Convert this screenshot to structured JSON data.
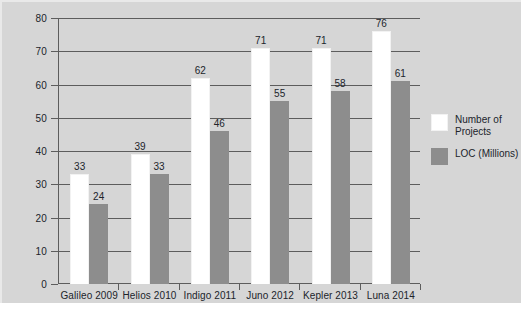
{
  "chart_data": {
    "type": "bar",
    "title": "",
    "subtitle": "",
    "xlabel": "",
    "ylabel": "",
    "ylim": [
      0,
      80
    ],
    "ytick_step": 10,
    "yticks": [
      0,
      10,
      20,
      30,
      40,
      50,
      60,
      70,
      80
    ],
    "grid": true,
    "grid_axis": "y",
    "legend_position": "right",
    "categories": [
      "Galileo 2009",
      "Helios 2010",
      "Indigo 2011",
      "Juno 2012",
      "Kepler 2013",
      "Luna 2014"
    ],
    "series": [
      {
        "name": "Number of Projects",
        "color": "#ffffff",
        "values": [
          33,
          39,
          62,
          71,
          71,
          76
        ],
        "labels": [
          "33",
          "39",
          "62",
          "71",
          "71",
          "76"
        ]
      },
      {
        "name": "LOC (Millions)",
        "color": "#8d8d8d",
        "values": [
          24,
          33,
          46,
          55,
          58,
          61
        ],
        "labels": [
          "24",
          "33",
          "46",
          "55",
          "58",
          "61"
        ]
      }
    ]
  },
  "legend": {
    "entries": [
      {
        "label": "Number of Projects",
        "swatch": "#ffffff",
        "icon": "legend-swatch-white"
      },
      {
        "label": "LOC (Millions)",
        "swatch": "#8d8d8d",
        "icon": "legend-swatch-gray"
      }
    ]
  },
  "colors": {
    "plot_background": "#d6d6d6",
    "page_background": "#ffffff",
    "axis": "#5d5d5d",
    "gridline": "#5d5d5d",
    "text": "#20242b",
    "series_projects": "#ffffff",
    "series_loc": "#8d8d8d"
  },
  "axis": {
    "y_tick_labels": [
      "0",
      "10",
      "20",
      "30",
      "40",
      "50",
      "60",
      "70",
      "80"
    ],
    "x_tick_labels": [
      "Galileo 2009",
      "Helios 2010",
      "Indigo 2011",
      "Juno 2012",
      "Kepler 2013",
      "Luna 2014"
    ]
  }
}
